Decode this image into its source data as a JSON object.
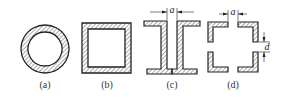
{
  "figure": {
    "panels": [
      {
        "id": "a",
        "label": "(a)",
        "shape": "hollow circular tube (ring cross-section)"
      },
      {
        "id": "b",
        "label": "(b)",
        "shape": "hollow square tube cross-section"
      },
      {
        "id": "c",
        "label": "(c)",
        "shape": "two channel sections facing outward separated by gap",
        "dimension_label": "a"
      },
      {
        "id": "d",
        "label": "(d)",
        "shape": "four angle sections forming split square",
        "dimension_labels": [
          "a",
          "d"
        ]
      }
    ],
    "colors": {
      "stroke": "#222222",
      "hatch": "#555555",
      "background": "#ffffff"
    }
  }
}
